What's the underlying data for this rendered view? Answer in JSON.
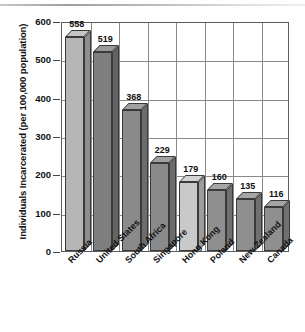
{
  "chart_data": {
    "type": "bar",
    "title": "",
    "xlabel": "",
    "ylabel": "Individuals Incarcerated (per 100,000 population)",
    "categories": [
      "Russia",
      "United States",
      "South Africa",
      "Singapore",
      "Hong Kong",
      "Poland",
      "New Zealand",
      "Canada"
    ],
    "values": [
      558,
      519,
      368,
      229,
      179,
      160,
      135,
      116
    ],
    "value_labels": [
      "558",
      "519",
      "368",
      "229",
      "179",
      "160",
      "135",
      "116"
    ],
    "ylim": [
      0,
      600
    ],
    "yticks": [
      0,
      100,
      200,
      300,
      400,
      500,
      600
    ],
    "ytick_labels": [
      "0",
      "100",
      "200",
      "300",
      "400",
      "500",
      "600"
    ],
    "grid": true,
    "legend": "none",
    "style": "3d-bar",
    "bar_colors": [
      "#b6b6b6",
      "#7f7f7f",
      "#8a8a8a",
      "#8a8a8a",
      "#c9c9c9",
      "#8f8f8f",
      "#8f8f8f",
      "#8f8f8f"
    ]
  },
  "axis": {
    "y_title": "Individuals Incarcerated (per 100,000 population)"
  }
}
